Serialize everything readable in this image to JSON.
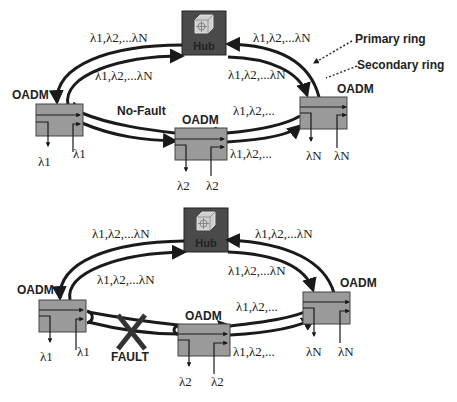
{
  "diagrams": [
    {
      "id": "no-fault",
      "status_label": "No-Fault",
      "hub_label": "Hub",
      "nodes": [
        {
          "label": "OADM",
          "drop": "λ1",
          "add": "λ1"
        },
        {
          "label": "OADM",
          "drop": "λ2",
          "add": "λ2"
        },
        {
          "label": "OADM",
          "drop": "λN",
          "add": "λN"
        }
      ],
      "link_labels": {
        "hub_left_outer": "λ1,λ2,...λN",
        "hub_left_inner": "λ1,λ2,...λN",
        "hub_right_outer": "λ1,λ2,...λN",
        "hub_right_inner": "λ1,λ2,...λN",
        "bottom_right_outer": "λ1,λ2,...",
        "bottom_right_inner": "λ1,λ2,..."
      },
      "legend": {
        "primary": "Primary ring",
        "secondary": "Secondary ring"
      }
    },
    {
      "id": "fault",
      "status_label": "FAULT",
      "hub_label": "Hub",
      "nodes": [
        {
          "label": "OADM",
          "drop": "λ1",
          "add": "λ1"
        },
        {
          "label": "OADM",
          "drop": "λ2",
          "add": "λ2"
        },
        {
          "label": "OADM",
          "drop": "λN",
          "add": "λN"
        }
      ],
      "link_labels": {
        "hub_left_outer": "λ1,λ2,...λN",
        "hub_left_inner": "λ1,λ2,...λN",
        "hub_right_outer": "λ1,λ2,...λN",
        "hub_right_inner": "λ1,λ2,...λN",
        "bottom_right_outer": "λ1,λ2,...",
        "bottom_right_inner": "λ1,λ2,..."
      }
    }
  ],
  "colors": {
    "ring": "#1a1a1a",
    "node_fill": "#9a9a9a",
    "hub_fill": "#4a4a4a",
    "fault": "#333333"
  }
}
